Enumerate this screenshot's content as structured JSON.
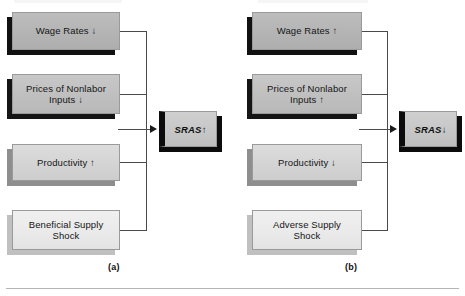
{
  "figure": {
    "bottom_rule_visible": true,
    "panels": [
      {
        "id": "a",
        "caption": "(a)",
        "result": {
          "label": "SRAS",
          "direction": "↑"
        },
        "inputs": [
          {
            "label": "Wage Rates ↓"
          },
          {
            "label": "Prices of Nonlabor\nInputs ↓"
          },
          {
            "label": "Productivity ↑"
          },
          {
            "label": "Beneficial Supply\nShock"
          }
        ]
      },
      {
        "id": "b",
        "caption": "(b)",
        "result": {
          "label": "SRAS",
          "direction": "↓"
        },
        "inputs": [
          {
            "label": "Wage Rates ↑"
          },
          {
            "label": "Prices of Nonlabor\nInputs ↑"
          },
          {
            "label": "Productivity ↓"
          },
          {
            "label": "Adverse Supply\nShock"
          }
        ]
      }
    ]
  },
  "colors": {
    "box_border": "#9a9a9a",
    "shadow_dark": "#111111",
    "shadow_mid": "#8e8e8e",
    "shadow_light": "#c0c0c0",
    "connector": "#4a4a4a",
    "result_edge": "#0c0c0c",
    "rule": "#b5b5b5",
    "text": "#151515"
  }
}
